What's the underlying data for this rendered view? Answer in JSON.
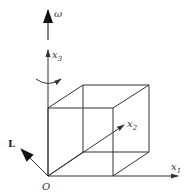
{
  "diagram": {
    "type": "cube-with-axes",
    "labels": {
      "omega": "ω",
      "x3": "x",
      "x3_sub": "3",
      "x2": "x",
      "x2_sub": "2",
      "x1": "x",
      "x1_sub": "1",
      "L": "L",
      "origin": "O"
    },
    "colors": {
      "stroke": "#333333",
      "background": "#ffffff"
    }
  }
}
